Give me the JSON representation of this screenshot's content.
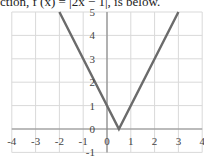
{
  "caption": "ction, f (x) = |2x − 1|, is below.",
  "chart_data": {
    "type": "line",
    "title": "",
    "function": "f(x) = |2x - 1|",
    "xlabel": "",
    "ylabel": "",
    "xlim": [
      -4,
      4
    ],
    "ylim": [
      -1,
      5
    ],
    "grid": true,
    "x_ticks": [
      -4,
      -3,
      -2,
      -1,
      0,
      1,
      2,
      3,
      4
    ],
    "y_ticks": [
      5,
      4,
      3,
      2,
      1,
      0,
      -1
    ],
    "series": [
      {
        "name": "f(x) = |2x - 1|",
        "color": "#6b6b6b",
        "x": [
          -2,
          0.5,
          3
        ],
        "y": [
          5,
          0,
          5
        ]
      }
    ]
  }
}
